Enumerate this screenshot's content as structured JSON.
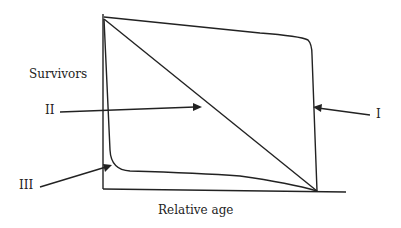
{
  "diagram": {
    "y_axis_label": "Survivors",
    "x_axis_label": "Relative age",
    "curves": [
      {
        "id": "I",
        "label": "I",
        "shape": "convex: high survival until late age, then sharp drop"
      },
      {
        "id": "II",
        "label": "II",
        "shape": "straight diagonal: constant mortality"
      },
      {
        "id": "III",
        "label": "III",
        "shape": "concave: steep early drop, then low plateau"
      }
    ],
    "colors": {
      "line": "#222222",
      "background": "#ffffff"
    }
  }
}
